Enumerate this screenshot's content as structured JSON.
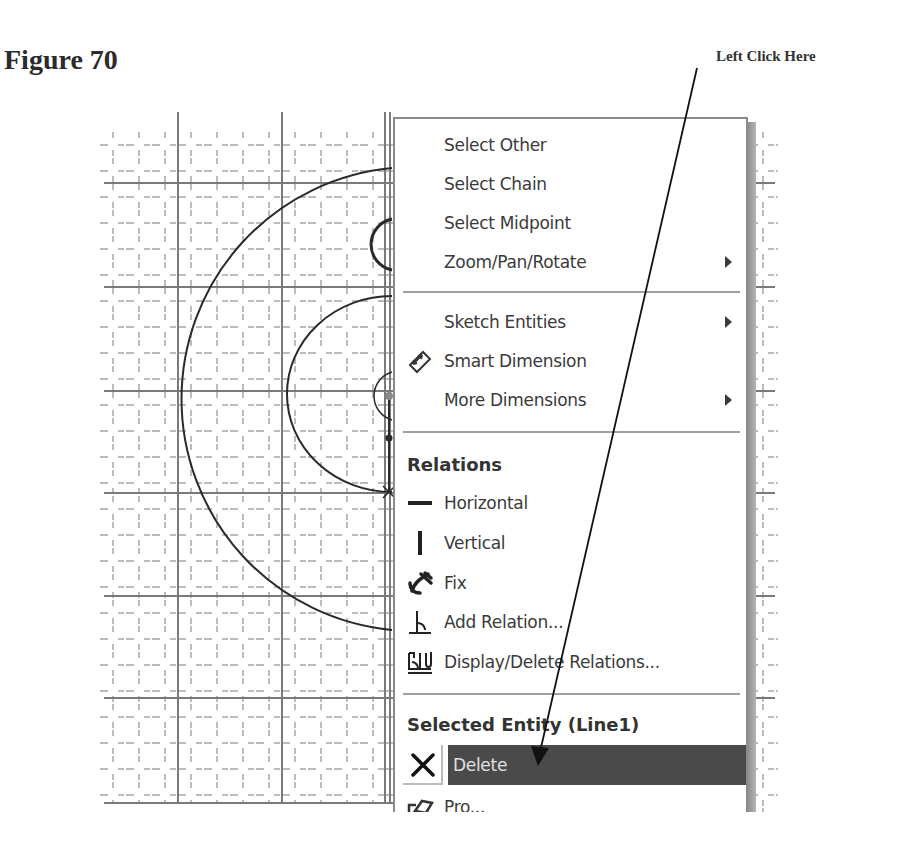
{
  "figure": {
    "title": "Figure 70",
    "callout_text": "Left Click Here"
  },
  "context_menu": {
    "items": [
      {
        "label": "Select Other",
        "icon": null,
        "submenu": false
      },
      {
        "label": "Select Chain",
        "icon": null,
        "submenu": false
      },
      {
        "label": "Select Midpoint",
        "icon": null,
        "submenu": false
      },
      {
        "label": "Zoom/Pan/Rotate",
        "icon": null,
        "submenu": true
      },
      {
        "label": "Sketch Entities",
        "icon": null,
        "submenu": true
      },
      {
        "label": "Smart Dimension",
        "icon": "smart-dimension-icon",
        "submenu": false
      },
      {
        "label": "More Dimensions",
        "icon": null,
        "submenu": true
      }
    ],
    "relations_header": "Relations",
    "relations": [
      {
        "label": "Horizontal",
        "icon": "horizontal-relation-icon"
      },
      {
        "label": "Vertical",
        "icon": "vertical-relation-icon"
      },
      {
        "label": "Fix",
        "icon": "fix-anchor-icon"
      },
      {
        "label": "Add Relation...",
        "icon": "add-relation-icon"
      },
      {
        "label": "Display/Delete Relations...",
        "icon": "display-delete-relations-icon"
      }
    ],
    "entity_header": "Selected Entity (Line1)",
    "entity_items": [
      {
        "label": "Delete",
        "icon": "delete-x-icon",
        "highlighted": true
      },
      {
        "label": "Pro...",
        "icon": "properties-icon",
        "highlighted": false
      }
    ]
  },
  "colors": {
    "highlight": "#4a4a4a",
    "grid_major": "#7a7a7a",
    "grid_minor": "#9a9a9a",
    "sketch": "#2a2a2a"
  }
}
